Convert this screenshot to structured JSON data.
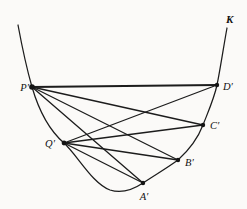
{
  "figure": {
    "curve_label": "K",
    "colors": {
      "ink": "#1c1c1c",
      "background": "#fbfaf8"
    },
    "curve_label_pos": {
      "x": 226,
      "y": 23
    },
    "curve_path": "M 18 25 C 23 52, 28 73, 32 87 C 39 111, 50 131, 64 143 C 78 156, 92 183, 110 190 C 122 194, 134 189, 143 183 C 155 175, 167 168, 178 160 C 189 150, 198 138, 203 125 C 208 112, 214 99, 217 85 C 220 71, 224 44, 227 28",
    "points": [
      {
        "id": "P",
        "label": "P′",
        "x": 32,
        "y": 87,
        "r": 2.8,
        "label_x": 29,
        "label_y": 91,
        "anchor": "end"
      },
      {
        "id": "D",
        "label": "D′",
        "x": 217,
        "y": 85,
        "r": 2.2,
        "label_x": 223,
        "label_y": 90,
        "anchor": "start"
      },
      {
        "id": "C",
        "label": "C′",
        "x": 203,
        "y": 125,
        "r": 2.2,
        "label_x": 210,
        "label_y": 129,
        "anchor": "start"
      },
      {
        "id": "Q",
        "label": "Q′",
        "x": 64,
        "y": 143,
        "r": 2.4,
        "label_x": 55,
        "label_y": 147,
        "anchor": "end"
      },
      {
        "id": "B",
        "label": "B′",
        "x": 178,
        "y": 160,
        "r": 2.2,
        "label_x": 185,
        "label_y": 166,
        "anchor": "start"
      },
      {
        "id": "A",
        "label": "A′",
        "x": 143,
        "y": 183,
        "r": 2.2,
        "label_x": 144,
        "label_y": 200,
        "anchor": "middle"
      }
    ],
    "edges": [
      {
        "from": "P",
        "to": "D",
        "width": 1.8
      },
      {
        "from": "P",
        "to": "C",
        "width": 1.3
      },
      {
        "from": "P",
        "to": "B",
        "width": 1.3
      },
      {
        "from": "P",
        "to": "A",
        "width": 1.3
      },
      {
        "from": "Q",
        "to": "D",
        "width": 1.3
      },
      {
        "from": "Q",
        "to": "C",
        "width": 1.3
      },
      {
        "from": "Q",
        "to": "B",
        "width": 1.3
      },
      {
        "from": "Q",
        "to": "A",
        "width": 1.3
      }
    ]
  }
}
